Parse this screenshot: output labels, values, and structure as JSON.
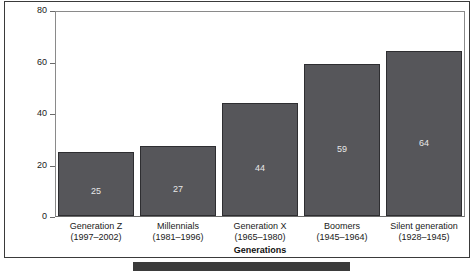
{
  "chart_data": {
    "type": "bar",
    "title": "",
    "subtitle": "",
    "xlabel": "Generations",
    "ylabel": "% Voting in every election",
    "categories": [
      "Generation Z",
      "Millennials",
      "Generation X",
      "Boomers",
      "Silent generation"
    ],
    "category_sublabels": [
      "(1997–2002)",
      "(1981–1996)",
      "(1965–1980)",
      "(1945–1964)",
      "(1928–1945)"
    ],
    "values": [
      25,
      27,
      44,
      59,
      64
    ],
    "value_labels": [
      "25",
      "27",
      "44",
      "59",
      "64"
    ],
    "ylim": [
      0,
      80
    ],
    "yticks": [
      0,
      20,
      40,
      60,
      80
    ],
    "ytick_labels": [
      "0",
      "20",
      "40",
      "60",
      "80"
    ],
    "grid": false,
    "legend": "none",
    "bar_color": "#56565a",
    "bar_edge_color": "#2e2e31",
    "value_label_color": "#e8e8e8",
    "axis_color": "#6a6a6a",
    "background": "#ffffff"
  },
  "bottom_strip": {
    "text": ""
  }
}
